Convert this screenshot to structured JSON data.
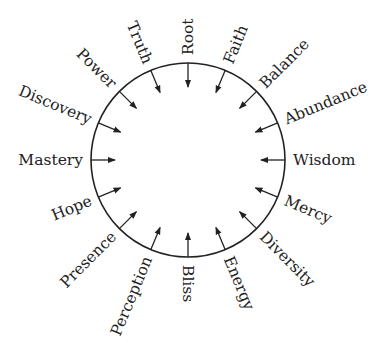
{
  "diagram": {
    "type": "radial-arrow-wheel",
    "center": [
      188,
      160
    ],
    "radius": 97,
    "arrow_length": 24,
    "label_gap": 8,
    "stroke_color": "#222222",
    "labels": [
      "Root",
      "Faith",
      "Balance",
      "Abundance",
      "Wisdom",
      "Mercy",
      "Diversity",
      "Energy",
      "Bliss",
      "Perception",
      "Presence",
      "Hope",
      "Mastery",
      "Discovery",
      "Power",
      "Truth"
    ],
    "arrow_direction": "inward"
  }
}
